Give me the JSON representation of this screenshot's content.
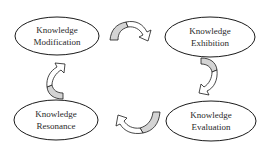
{
  "diagram": {
    "type": "cycle",
    "nodes": [
      {
        "id": "modification",
        "line1": "Knowledge",
        "line2": "Modification",
        "cx": 57,
        "cy": 36
      },
      {
        "id": "exhibition",
        "line1": "Knowledge",
        "line2": "Exhibition",
        "cx": 210,
        "cy": 37
      },
      {
        "id": "evaluation",
        "line1": "Knowledge",
        "line2": "Evaluation",
        "cx": 211,
        "cy": 121
      },
      {
        "id": "resonance",
        "line1": "Knowledge",
        "line2": "Resonance",
        "cx": 56,
        "cy": 120
      }
    ],
    "edges": [
      {
        "from": "modification",
        "to": "exhibition"
      },
      {
        "from": "exhibition",
        "to": "evaluation"
      },
      {
        "from": "evaluation",
        "to": "resonance"
      },
      {
        "from": "resonance",
        "to": "modification"
      }
    ],
    "colors": {
      "stroke": "#1a1a1a",
      "arrow_fill_shaded": "#d4d4d4",
      "arrow_fill_light": "#ffffff",
      "background": "#ffffff"
    }
  }
}
